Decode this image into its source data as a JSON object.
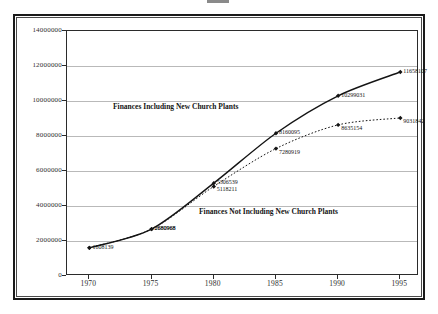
{
  "figure": {
    "title_cropped": "",
    "background_color": "#ffffff",
    "frame_color": "#1a1a1a",
    "grid_color": "#b9b9b9",
    "series_color": "#141414"
  },
  "chart_data": {
    "type": "line",
    "title": "",
    "xlabel": "",
    "ylabel": "",
    "x": [
      1970,
      1975,
      1980,
      1985,
      1990,
      1995
    ],
    "xtick_labels": [
      "1970",
      "1975",
      "1980",
      "1985",
      "1990",
      "1995"
    ],
    "ytick_labels": [
      "0",
      "2000000",
      "4000000",
      "6000000",
      "8000000",
      "10000000",
      "12000000",
      "14000000"
    ],
    "yticks": [
      0,
      2000000,
      4000000,
      6000000,
      8000000,
      10000000,
      12000000,
      14000000
    ],
    "xlim": [
      1968.2,
      1996.5
    ],
    "ylim": [
      0,
      14000000
    ],
    "grid": "horizontal",
    "legend": "none",
    "series": [
      {
        "name": "Finances Including New Church Plants",
        "style": "solid",
        "marker": "diamond",
        "values": [
          1608139,
          2680968,
          5306539,
          8160095,
          10299031,
          11658107
        ],
        "labels": [
          "1608139",
          "2680968",
          "5306539",
          "8160095",
          "10299031",
          "11658107"
        ]
      },
      {
        "name": "Finances Not Including New Church Plants",
        "style": "dotted",
        "marker": "diamond",
        "values": [
          1608139,
          2680968,
          5118211,
          7280919,
          8635154,
          9031842
        ],
        "labels": [
          "",
          "2680968",
          "5118211",
          "7280919",
          "8635154",
          "9031842"
        ]
      }
    ],
    "annotations": [
      {
        "text": "Finances Including New Church Plants",
        "x_px": 113,
        "y_px": 102
      },
      {
        "text": "Finances Not Including New Church Plants",
        "x_px": 199,
        "y_px": 207
      }
    ]
  }
}
